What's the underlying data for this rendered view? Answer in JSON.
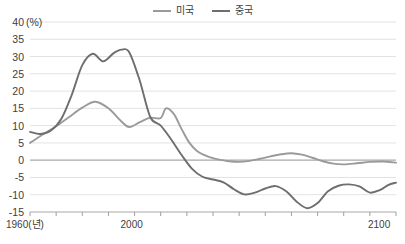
{
  "chart_data": {
    "type": "line",
    "title": "",
    "xlabel": "1960(년)",
    "ylabel": "(%)",
    "unit_label": "(%)",
    "grid": true,
    "legend_position": "top-center",
    "xlim": [
      1960,
      2100
    ],
    "ylim": [
      -15,
      40
    ],
    "ytick_values": [
      40,
      35,
      30,
      25,
      20,
      15,
      10,
      5,
      0,
      -5,
      -10,
      -15
    ],
    "ytick_labels": [
      "40",
      "35",
      "30",
      "25",
      "20",
      "15",
      "10",
      "5",
      "0",
      "-5",
      "-10",
      "-15"
    ],
    "xtick_values": [
      1960,
      1970,
      1980,
      1990,
      2000,
      2010,
      2020,
      2030,
      2040,
      2050,
      2060,
      2070,
      2080,
      2090,
      2100
    ],
    "xtick_labels_shown": [
      "1960(년)",
      "2000",
      "2100"
    ],
    "xtick_label_positions": [
      1960,
      2000,
      2100
    ],
    "series": [
      {
        "name": "미국",
        "color": "#9a9a9a",
        "x": [
          1960,
          1965,
          1970,
          1975,
          1980,
          1985,
          1990,
          1995,
          1998,
          2002,
          2006,
          2010,
          2012,
          2015,
          2018,
          2021,
          2024,
          2027,
          2030,
          2033,
          2036,
          2040,
          2044,
          2048,
          2052,
          2056,
          2060,
          2064,
          2068,
          2072,
          2076,
          2080,
          2085,
          2090,
          2095,
          2100
        ],
        "values": [
          5.0,
          7.5,
          9.8,
          12.5,
          15.2,
          16.9,
          15.0,
          11.2,
          9.6,
          11.0,
          12.3,
          12.2,
          15.0,
          13.4,
          9.0,
          5.0,
          2.6,
          1.4,
          0.6,
          0.1,
          -0.3,
          -0.5,
          -0.2,
          0.4,
          1.1,
          1.7,
          2.0,
          1.6,
          0.7,
          -0.3,
          -1.0,
          -1.2,
          -0.9,
          -0.5,
          -0.4,
          -0.7
        ]
      },
      {
        "name": "중국",
        "color": "#6e6e6e",
        "x": [
          1960,
          1964,
          1968,
          1972,
          1976,
          1980,
          1984,
          1988,
          1992,
          1995,
          1998,
          2002,
          2006,
          2010,
          2014,
          2018,
          2022,
          2026,
          2030,
          2034,
          2038,
          2042,
          2046,
          2050,
          2054,
          2058,
          2062,
          2066,
          2070,
          2074,
          2078,
          2082,
          2086,
          2090,
          2094,
          2097,
          2100
        ],
        "values": [
          8.2,
          7.6,
          8.6,
          12.0,
          19.0,
          27.5,
          30.8,
          28.6,
          31.0,
          32.0,
          31.2,
          23.0,
          12.5,
          10.0,
          6.0,
          1.5,
          -2.5,
          -4.8,
          -5.6,
          -6.4,
          -8.4,
          -9.9,
          -9.4,
          -8.2,
          -7.5,
          -9.0,
          -12.0,
          -13.9,
          -12.4,
          -9.0,
          -7.4,
          -7.0,
          -7.6,
          -9.4,
          -8.6,
          -7.2,
          -6.5
        ]
      }
    ]
  },
  "legend": {
    "items": [
      {
        "label": "미국",
        "color": "#9a9a9a"
      },
      {
        "label": "중국",
        "color": "#6e6e6e"
      }
    ]
  },
  "axes": {
    "y_unit": "(%)",
    "x_first_label": "1960(년)",
    "x_mid_label": "2000",
    "x_last_label": "2100"
  }
}
